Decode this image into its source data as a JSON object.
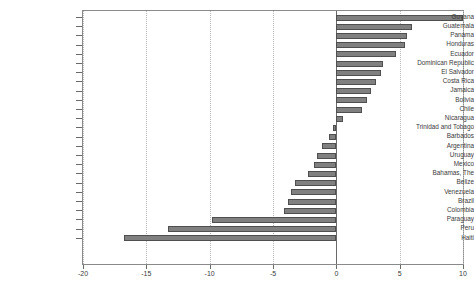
{
  "chart_data": {
    "type": "bar",
    "orientation": "horizontal",
    "title": "",
    "subtitle": "",
    "xlabel": "",
    "ylabel": "",
    "xlim": [
      -20,
      10
    ],
    "xticks": [
      -20,
      -15,
      -10,
      -5,
      0,
      5,
      10
    ],
    "xtick_labels": [
      "-20",
      "-15",
      "-10",
      "-5",
      "0",
      "5",
      "10"
    ],
    "grid": true,
    "grid_axis": "x",
    "legend": null,
    "bar_color": "#808080",
    "bar_edge_color": "#4f4f4f",
    "axis_color": "#8a8a8a",
    "gridline_color": "#b9b9b9",
    "categories": [
      "Guyana",
      "Guatemala",
      "Panama",
      "Honduras",
      "Ecuador",
      "Dominican Republic",
      "El Salvador",
      "Costa Rica",
      "Jamaica",
      "Bolivia",
      "Chile",
      "Nicaragua",
      "Trinidad and Tobago",
      "Barbados",
      "Argentina",
      "Uruguay",
      "Mexico",
      "Bahamas, The",
      "Belize",
      "Venezuela",
      "Brazil",
      "Colombia",
      "Paraguay",
      "Peru",
      "Haiti"
    ],
    "values": [
      10.0,
      6.0,
      5.6,
      5.4,
      4.7,
      3.7,
      3.5,
      3.1,
      2.7,
      2.4,
      2.0,
      0.5,
      -0.3,
      -0.6,
      -1.1,
      -1.5,
      -1.8,
      -2.2,
      -3.3,
      -3.6,
      -3.8,
      -4.1,
      -9.8,
      -13.3,
      -16.8
    ]
  }
}
